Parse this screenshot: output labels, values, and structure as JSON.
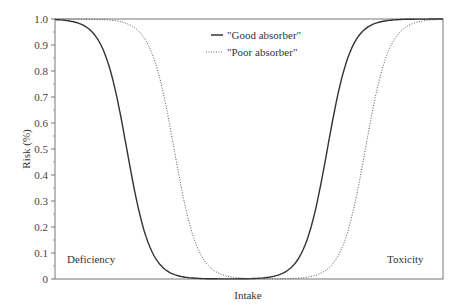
{
  "chart_data": {
    "type": "line",
    "title": "",
    "xlabel": "Intake",
    "ylabel": "Risk (%)",
    "ylim": [
      0,
      1.0
    ],
    "xlim": [
      0,
      100
    ],
    "yticks": [
      "0",
      "0.1",
      "0.2",
      "0.3",
      "0.4",
      "0.5",
      "0.6",
      "0.7",
      "0.8",
      "0.9",
      "1.0"
    ],
    "grid": false,
    "legend_position": "top-center",
    "series": [
      {
        "name": "\"Good absorber\"",
        "style": "solid",
        "color": "#333333",
        "deficiency_midpoint_x": 18.5,
        "toxicity_midpoint_x": 70.2,
        "x": [
          0,
          5,
          10,
          15,
          18.5,
          22,
          26,
          30,
          35,
          40,
          45,
          50,
          55,
          60,
          65,
          70.2,
          75,
          80,
          85,
          90,
          95,
          100
        ],
        "values": [
          1.0,
          0.98,
          0.91,
          0.72,
          0.5,
          0.29,
          0.12,
          0.04,
          0.01,
          0.0,
          0.0,
          0.0,
          0.01,
          0.04,
          0.16,
          0.5,
          0.8,
          0.95,
          0.99,
          1.0,
          1.0,
          1.0
        ]
      },
      {
        "name": "\"Poor absorber\"",
        "style": "dotted",
        "color": "#555555",
        "deficiency_midpoint_x": 30.7,
        "toxicity_midpoint_x": 80.0,
        "x": [
          0,
          10,
          15,
          20,
          25,
          30.7,
          35,
          40,
          45,
          50,
          55,
          60,
          65,
          70,
          75,
          80,
          85,
          90,
          95,
          100
        ],
        "values": [
          1.0,
          1.0,
          0.99,
          0.94,
          0.8,
          0.5,
          0.3,
          0.11,
          0.03,
          0.0,
          0.0,
          0.0,
          0.01,
          0.05,
          0.18,
          0.5,
          0.8,
          0.95,
          0.99,
          1.0
        ]
      }
    ],
    "annotations": [
      {
        "text": "Deficiency",
        "x": 3,
        "y": 0.07
      },
      {
        "text": "Toxicity",
        "x": 86,
        "y": 0.07
      }
    ]
  },
  "legend": {
    "items": [
      "\"Good absorber\"",
      "\"Poor absorber\""
    ]
  },
  "labels": {
    "xlabel": "Intake",
    "ylabel": "Risk (%)",
    "deficiency": "Deficiency",
    "toxicity": "Toxicity"
  }
}
